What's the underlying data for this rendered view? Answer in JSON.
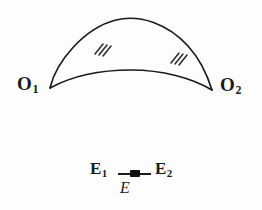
{
  "figure": {
    "background_color": "#fdfdfd",
    "ink_color": "#1a1a1a"
  },
  "lune": {
    "left_vertex": {
      "label": "O",
      "subscript": "1",
      "x": 50,
      "y": 88
    },
    "right_vertex": {
      "label": "O",
      "subscript": "2",
      "x": 212,
      "y": 90
    },
    "upper_arc": {
      "name": "upper-arc",
      "apex_x": 131,
      "apex_y": 20,
      "tick_marks": 3
    },
    "lower_arc": {
      "name": "lower-arc",
      "apex_x": 131,
      "apex_y": 70,
      "tick_marks": 3
    },
    "tick_mark_left": {
      "x": 100,
      "y": 48,
      "count": 3
    },
    "tick_mark_right": {
      "x": 176,
      "y": 57,
      "count": 3
    }
  },
  "segment": {
    "left_endpoint": {
      "label": "E",
      "subscript": "1"
    },
    "right_endpoint": {
      "label": "E",
      "subscript": "2"
    },
    "midpoint_label": "E",
    "midpoint_marker": "filled-square"
  }
}
